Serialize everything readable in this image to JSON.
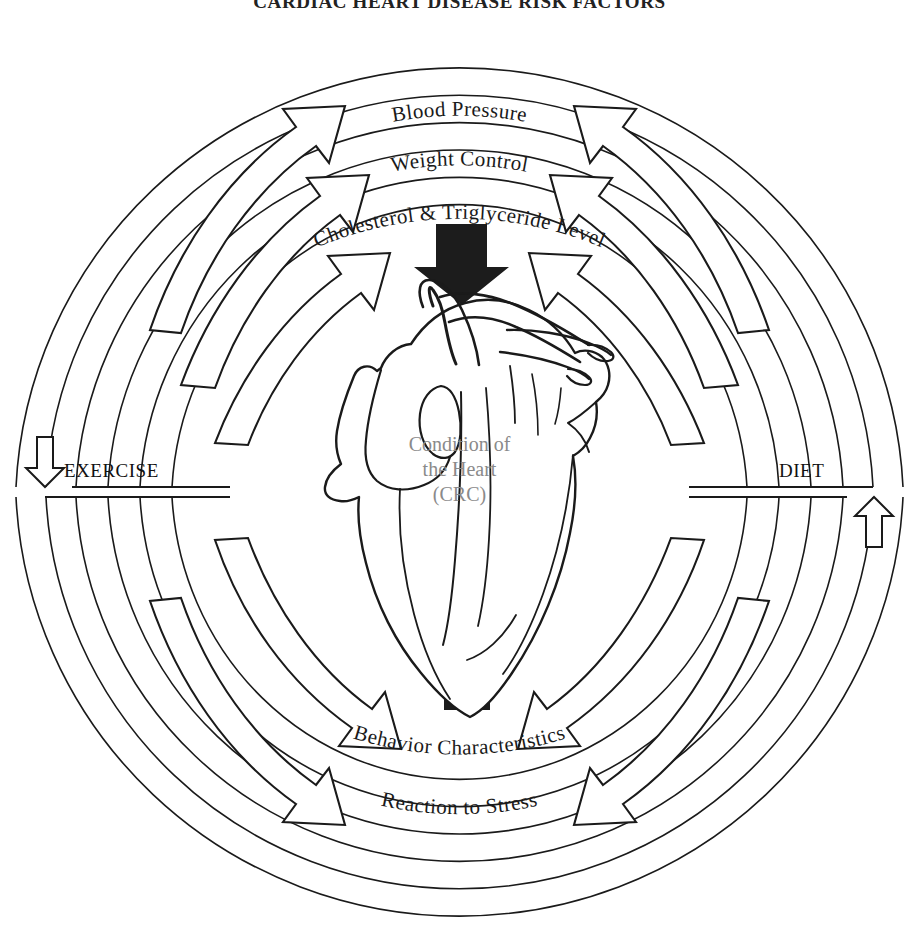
{
  "title": "CARDIAC HEART DISEASE RISK FACTORS",
  "diagram": {
    "type": "cyclical-influence-diagram",
    "center": {
      "illustration": "anatomical-heart",
      "lines": [
        "Condition of",
        "the Heart",
        "(CRC)"
      ],
      "text_color": "#8a8a8a"
    },
    "side_labels": {
      "left": "EXERCISE",
      "right": "DIET"
    },
    "top_arc_labels": [
      "Blood Pressure",
      "Weight Control",
      "Cholesterol & Triglyceride Level"
    ],
    "bottom_arc_labels": [
      "Behavior Characteristics",
      "Reaction to Stress"
    ],
    "arrows": {
      "solid_top": "down-arrow-to-heart",
      "solid_bottom": "up-arrow-to-heart",
      "outline_upper_left_count": 3,
      "outline_upper_right_count": 3,
      "outline_lower_left_count": 2,
      "outline_lower_right_count": 2,
      "outline_left_terminal": "down-arrow",
      "outline_right_terminal": "up-arrow"
    },
    "stroke_color": "#1a1a1a",
    "fill_color": "#ffffff",
    "solid_arrow_color": "#1c1c1c"
  }
}
